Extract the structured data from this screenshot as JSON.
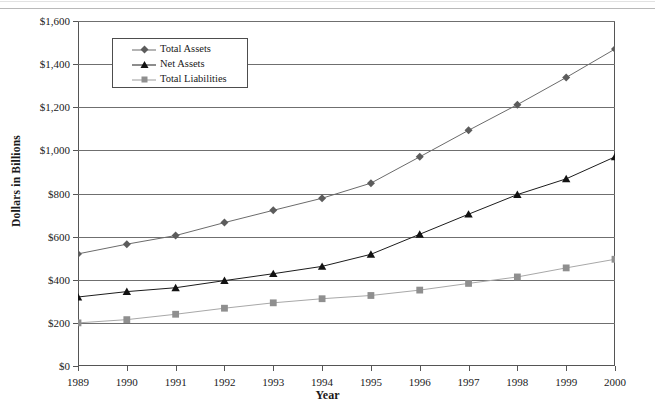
{
  "chart_data": {
    "type": "line",
    "title": "",
    "xlabel": "Year",
    "ylabel": "Dollars in Billions",
    "categories": [
      "1989",
      "1990",
      "1991",
      "1992",
      "1993",
      "1994",
      "1995",
      "1996",
      "1997",
      "1998",
      "1999",
      "2000"
    ],
    "x": [
      1989,
      1990,
      1991,
      1992,
      1993,
      1994,
      1995,
      1996,
      1997,
      1998,
      1999,
      2000
    ],
    "xlim": [
      1989,
      2000
    ],
    "ylim": [
      0,
      1600
    ],
    "yticks": [
      0,
      200,
      400,
      600,
      800,
      1000,
      1200,
      1400,
      1600
    ],
    "ytick_labels": [
      "$0",
      "$200",
      "$400",
      "$600",
      "$800",
      "$1,000",
      "$1,200",
      "$1,400",
      "$1,600"
    ],
    "grid": true,
    "legend_position": "upper-left-inside",
    "series": [
      {
        "name": "Total Assets",
        "marker": "diamond",
        "color": "#6b6b6b",
        "values": [
          520,
          565,
          605,
          665,
          722,
          778,
          848,
          970,
          1093,
          1212,
          1338,
          1470
        ]
      },
      {
        "name": "Net Assets",
        "marker": "triangle",
        "color": "#1c1c1c",
        "values": [
          320,
          345,
          363,
          396,
          428,
          462,
          518,
          611,
          704,
          795,
          868,
          970
        ]
      },
      {
        "name": "Total Liabilities",
        "marker": "square",
        "color": "#a8a8a8",
        "values": [
          200,
          215,
          240,
          268,
          293,
          312,
          327,
          352,
          383,
          413,
          455,
          495
        ]
      }
    ]
  },
  "axes": {
    "y_title": "Dollars in Billions",
    "x_title": "Year"
  },
  "legend": {
    "entries": [
      {
        "label": "Total Assets",
        "marker": "diamond-marker"
      },
      {
        "label": "Net Assets",
        "marker": "triangle-marker"
      },
      {
        "label": "Total Liabilities",
        "marker": "square-marker"
      }
    ]
  }
}
